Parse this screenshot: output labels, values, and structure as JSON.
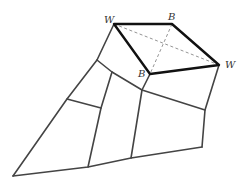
{
  "diagram": {
    "type": "planar-subdivision-with-highlighted-quadrilateral",
    "colors": {
      "edge": "#444444",
      "highlight": "#111111",
      "diagonal": "#888888",
      "label": "#333333"
    },
    "vertices": {
      "W1": [
        114,
        24
      ],
      "B1": [
        172,
        24
      ],
      "W2": [
        219,
        65
      ],
      "B2": [
        150,
        74
      ],
      "P1": [
        97,
        60
      ],
      "P2": [
        142,
        90
      ],
      "P3": [
        112,
        72
      ],
      "P4": [
        101,
        108
      ],
      "P5": [
        67,
        99
      ],
      "P6": [
        13,
        176
      ],
      "P7": [
        88,
        167
      ],
      "P8": [
        131,
        158
      ],
      "P9": [
        202,
        147
      ],
      "P10": [
        205,
        110
      ]
    },
    "labels": [
      {
        "id": "label-w-top-left",
        "text": "W",
        "x": 104,
        "y": 23
      },
      {
        "id": "label-b-top-right",
        "text": "B",
        "x": 168,
        "y": 20
      },
      {
        "id": "label-w-right",
        "text": "W",
        "x": 225,
        "y": 68
      },
      {
        "id": "label-b-bottom",
        "text": "B",
        "x": 138,
        "y": 77
      }
    ]
  }
}
